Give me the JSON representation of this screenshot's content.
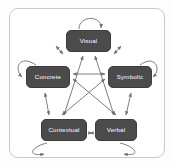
{
  "figure": {
    "background_color": "#ffffff",
    "frame_color": "#c9c9c9",
    "node_fill": "#4b4b4b",
    "node_text_color": "#ffffff",
    "arrow_color": "#6f6f6f"
  },
  "nodes": [
    {
      "id": "visual",
      "label": "Visual",
      "position": "top"
    },
    {
      "id": "concrete",
      "label": "Concrete",
      "position": "left"
    },
    {
      "id": "symbolic",
      "label": "Symbolic",
      "position": "right"
    },
    {
      "id": "contextual",
      "label": "Contextual",
      "position": "bottom-left"
    },
    {
      "id": "verbal",
      "label": "Verbal",
      "position": "bottom-right"
    }
  ],
  "self_loops": [
    {
      "node": "visual",
      "side": "top"
    },
    {
      "node": "concrete",
      "side": "left"
    },
    {
      "node": "symbolic",
      "side": "right"
    },
    {
      "node": "contextual",
      "side": "bottom-left"
    },
    {
      "node": "verbal",
      "side": "bottom-right"
    }
  ],
  "edges": [
    {
      "from": "visual",
      "to": "concrete",
      "style": "bidirectional"
    },
    {
      "from": "visual",
      "to": "symbolic",
      "style": "bidirectional"
    },
    {
      "from": "concrete",
      "to": "symbolic",
      "style": "bidirectional"
    },
    {
      "from": "concrete",
      "to": "contextual",
      "style": "bidirectional"
    },
    {
      "from": "symbolic",
      "to": "verbal",
      "style": "bidirectional"
    },
    {
      "from": "contextual",
      "to": "verbal",
      "style": "bidirectional"
    },
    {
      "from": "visual",
      "to": "contextual",
      "style": "bidirectional"
    },
    {
      "from": "visual",
      "to": "verbal",
      "style": "bidirectional"
    },
    {
      "from": "concrete",
      "to": "verbal",
      "style": "bidirectional"
    },
    {
      "from": "symbolic",
      "to": "contextual",
      "style": "bidirectional"
    }
  ]
}
